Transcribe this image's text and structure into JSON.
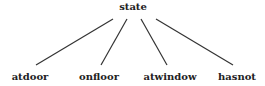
{
  "diagram": {
    "type": "tree",
    "root": {
      "label": "state",
      "x": 133,
      "y": 10
    },
    "children": [
      {
        "label": "atdoor",
        "x": 30,
        "y": 80,
        "edge": {
          "x1": 113,
          "y1": 19,
          "x2": 36,
          "y2": 65
        }
      },
      {
        "label": "onfloor",
        "x": 99,
        "y": 80,
        "edge": {
          "x1": 127,
          "y1": 19,
          "x2": 101,
          "y2": 65
        }
      },
      {
        "label": "atwindow",
        "x": 170,
        "y": 80,
        "edge": {
          "x1": 141,
          "y1": 19,
          "x2": 167,
          "y2": 65
        }
      },
      {
        "label": "hasnot",
        "x": 237,
        "y": 80,
        "edge": {
          "x1": 156,
          "y1": 19,
          "x2": 233,
          "y2": 65
        }
      }
    ]
  },
  "colors": {
    "text": "#222222",
    "edge": "#333333",
    "background": "#ffffff"
  }
}
